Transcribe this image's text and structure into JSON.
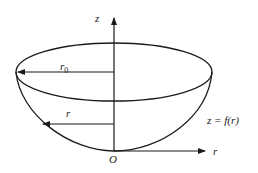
{
  "diagram": {
    "type": "hemispherical-bowl",
    "labels": {
      "z_axis": "z",
      "r_axis": "r",
      "origin": "O",
      "rim_radius": "r",
      "rim_radius_sub": "0",
      "radius": "r",
      "surface_equation": "z = f(r)"
    },
    "colors": {
      "stroke": "#1a1a1a",
      "background": "#ffffff"
    }
  }
}
